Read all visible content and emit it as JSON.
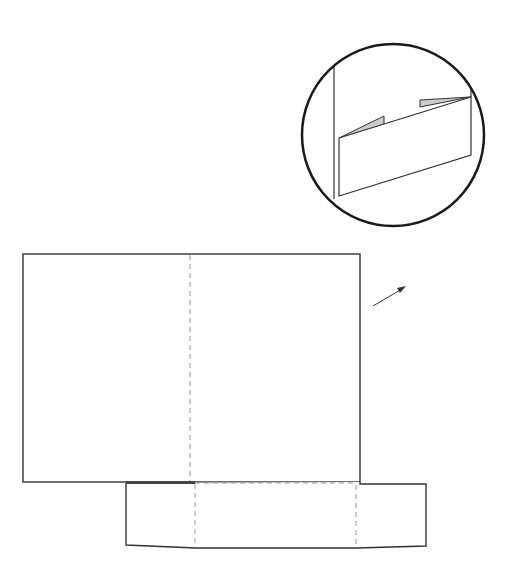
{
  "diagram": {
    "title": "",
    "colors": {
      "stroke": "#222222",
      "solid_edge": "#333333",
      "fold_line": "#999999",
      "tab_fill": "#cccccc",
      "background": "#ffffff"
    },
    "detail_circle": {
      "cx": 393,
      "cy": 135,
      "r": 92,
      "label": ""
    },
    "main_panel": {
      "x": 23,
      "y": 254,
      "width": 337,
      "height": 228,
      "fold_x": 190
    },
    "bottom_strip": {
      "left": 126,
      "right": 426,
      "top": 482,
      "bottom": 547,
      "fold_left_x": 195,
      "fold_right_x": 356
    },
    "arrow": {
      "x1": 373,
      "y1": 306,
      "x2": 405,
      "y2": 287
    }
  }
}
